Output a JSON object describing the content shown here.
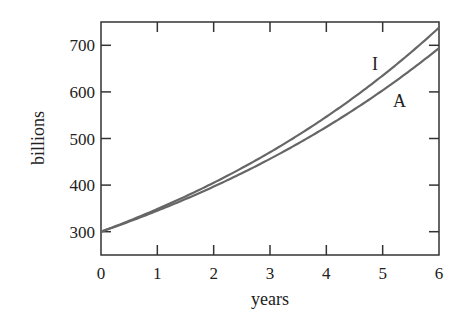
{
  "chart_data": {
    "type": "line",
    "title": "",
    "xlabel": "years",
    "ylabel": "billions",
    "xlim": [
      0,
      6
    ],
    "ylim": [
      250,
      750
    ],
    "xticks": [
      0,
      1,
      2,
      3,
      4,
      5,
      6
    ],
    "yticks": [
      300,
      400,
      500,
      600,
      700
    ],
    "grid": false,
    "legend": "inline labels",
    "x": [
      0,
      1,
      2,
      3,
      4,
      5,
      6
    ],
    "series": [
      {
        "name": "I",
        "values": [
          300,
          349,
          405,
          470,
          547,
          635,
          738
        ],
        "color": "#666666"
      },
      {
        "name": "A",
        "values": [
          300,
          345,
          397,
          456,
          525,
          603,
          694
        ],
        "color": "#666666"
      }
    ],
    "annotations": [
      {
        "text": "I",
        "x": 4.85,
        "y": 660
      },
      {
        "text": "A",
        "x": 5.25,
        "y": 575
      }
    ]
  },
  "labels": {
    "xlabel": "years",
    "ylabel": "billions",
    "curve_I": "I",
    "curve_A": "A"
  },
  "colors": {
    "axis": "#333333",
    "curve": "#666666"
  }
}
